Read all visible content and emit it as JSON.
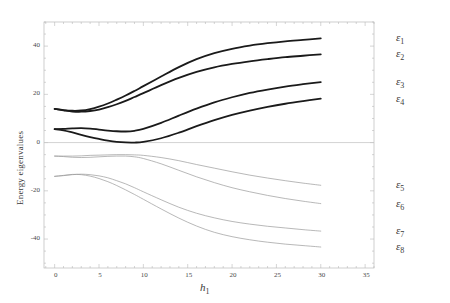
{
  "chart_data": {
    "type": "line",
    "title": "",
    "xlabel": "h₁",
    "ylabel": "Energy eigenvalues",
    "xlim": [
      -1.2,
      36
    ],
    "ylim": [
      -52,
      50
    ],
    "xticks": [
      0,
      5,
      10,
      15,
      20,
      25,
      30,
      35
    ],
    "xticklabels": [
      "0",
      "5",
      "10",
      "15",
      "20",
      "25",
      "30",
      "35"
    ],
    "yticks": [
      40,
      20,
      0,
      -20,
      -40
    ],
    "yticklabels": [
      "40",
      "20",
      "0",
      "-20",
      "-40"
    ],
    "grid": false,
    "zero_line": true,
    "legend_position": "right-outside",
    "x": [
      0,
      1,
      2,
      3,
      4,
      5,
      6,
      7,
      8,
      9,
      10,
      12,
      14,
      16,
      18,
      20,
      22,
      24,
      26,
      28,
      30
    ],
    "series": [
      {
        "name": "ε₁",
        "label": "ε",
        "sub": "1",
        "color": "#1a1a1a",
        "width": 1.8,
        "values": [
          14.0,
          13.5,
          13.2,
          13.3,
          13.9,
          14.9,
          16.2,
          17.8,
          19.5,
          21.4,
          23.4,
          27.4,
          31.3,
          34.6,
          37.1,
          38.9,
          40.2,
          41.2,
          42.0,
          42.6,
          43.2
        ]
      },
      {
        "name": "ε₂",
        "label": "ε",
        "sub": "2",
        "color": "#1a1a1a",
        "width": 1.8,
        "values": [
          14.0,
          13.4,
          12.9,
          12.8,
          13.1,
          13.7,
          14.7,
          15.9,
          17.3,
          18.9,
          20.5,
          23.8,
          26.8,
          29.3,
          31.2,
          32.6,
          33.7,
          34.6,
          35.4,
          36.0,
          36.6
        ]
      },
      {
        "name": "ε₃",
        "label": "ε",
        "sub": "3",
        "color": "#1a1a1a",
        "width": 1.8,
        "values": [
          5.6,
          5.7,
          5.9,
          6.0,
          5.8,
          5.4,
          5.0,
          4.7,
          4.6,
          4.9,
          5.7,
          8.2,
          11.2,
          14.1,
          16.7,
          18.8,
          20.6,
          22.0,
          23.2,
          24.2,
          25.1
        ]
      },
      {
        "name": "ε₄",
        "label": "ε",
        "sub": "4",
        "color": "#1a1a1a",
        "width": 1.8,
        "values": [
          5.6,
          5.1,
          4.2,
          3.2,
          2.3,
          1.5,
          0.8,
          0.3,
          0.05,
          0.02,
          0.3,
          1.8,
          4.1,
          6.8,
          9.3,
          11.5,
          13.3,
          14.8,
          16.1,
          17.2,
          18.2
        ]
      },
      {
        "name": "ε₅",
        "label": "ε",
        "sub": "5",
        "color": "#9a9a9a",
        "width": 0.7,
        "values": [
          -5.6,
          -5.6,
          -5.6,
          -5.5,
          -5.3,
          -5.2,
          -5.1,
          -5.0,
          -5.0,
          -5.1,
          -5.3,
          -6.2,
          -7.5,
          -9.1,
          -10.6,
          -12.1,
          -13.5,
          -14.7,
          -15.8,
          -16.8,
          -17.7
        ]
      },
      {
        "name": "ε₆",
        "label": "ε",
        "sub": "6",
        "color": "#9a9a9a",
        "width": 0.7,
        "values": [
          -5.6,
          -5.8,
          -6.1,
          -6.2,
          -6.1,
          -5.9,
          -5.7,
          -5.6,
          -5.6,
          -5.9,
          -6.6,
          -8.8,
          -11.5,
          -14.2,
          -16.6,
          -18.7,
          -20.4,
          -21.9,
          -23.2,
          -24.3,
          -25.3
        ]
      },
      {
        "name": "ε₇",
        "label": "ε",
        "sub": "7",
        "color": "#9a9a9a",
        "width": 0.7,
        "values": [
          -14.0,
          -13.7,
          -13.3,
          -13.1,
          -13.3,
          -13.8,
          -14.6,
          -15.8,
          -17.1,
          -18.7,
          -20.4,
          -23.7,
          -26.8,
          -29.3,
          -31.2,
          -32.7,
          -33.8,
          -34.7,
          -35.4,
          -36.1,
          -36.7
        ]
      },
      {
        "name": "ε₈",
        "label": "ε",
        "sub": "8",
        "color": "#9a9a9a",
        "width": 0.7,
        "values": [
          -14.0,
          -13.6,
          -13.2,
          -13.3,
          -13.9,
          -14.9,
          -16.2,
          -17.8,
          -19.6,
          -21.5,
          -23.5,
          -27.5,
          -31.3,
          -34.6,
          -37.2,
          -39.0,
          -40.3,
          -41.3,
          -42.1,
          -42.7,
          -43.3
        ]
      }
    ]
  },
  "legend": {
    "top_group": [
      "ε₁",
      "ε₂",
      "ε₃",
      "ε₄"
    ],
    "bottom_group": [
      "ε₅",
      "ε₆",
      "ε₇",
      "ε₈"
    ]
  },
  "colors": {
    "upper_branch": "#1a1a1a",
    "lower_branch": "#9a9a9a",
    "frame": "#b9b9b9",
    "zero_line": "#c8c8c8",
    "text": "#3a3a3a",
    "background": "#ffffff"
  }
}
